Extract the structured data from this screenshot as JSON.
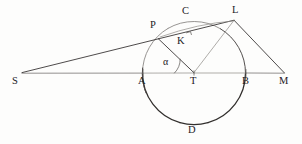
{
  "figure": {
    "kind": "geometric-construction-diagram",
    "width": 302,
    "height": 144,
    "background_color": "#fdfdfc",
    "ink_color": "#2e2b2a",
    "labels": [
      {
        "id": "S",
        "text": "S",
        "x": 12,
        "y": 76,
        "anchor_x": 22,
        "anchor_y": 73
      },
      {
        "id": "A",
        "text": "A",
        "x": 138,
        "y": 76,
        "anchor_x": 143,
        "anchor_y": 73
      },
      {
        "id": "T",
        "text": "T",
        "x": 190,
        "y": 76,
        "anchor_x": 194,
        "anchor_y": 73
      },
      {
        "id": "B",
        "text": "B",
        "x": 242,
        "y": 76,
        "anchor_x": 246,
        "anchor_y": 73
      },
      {
        "id": "M",
        "text": "M",
        "x": 279,
        "y": 76,
        "anchor_x": 284,
        "anchor_y": 73
      },
      {
        "id": "P",
        "text": "P",
        "x": 150,
        "y": 20,
        "anchor_x": 158,
        "anchor_y": 38
      },
      {
        "id": "C",
        "text": "C",
        "x": 182,
        "y": 6,
        "anchor_x": 192,
        "anchor_y": 22
      },
      {
        "id": "L",
        "text": "L",
        "x": 232,
        "y": 5,
        "anchor_x": 234,
        "anchor_y": 20
      },
      {
        "id": "K",
        "text": "K",
        "x": 177,
        "y": 36,
        "anchor_x": 189,
        "anchor_y": 31
      },
      {
        "id": "D",
        "text": "D",
        "x": 188,
        "y": 125,
        "anchor_x": 194,
        "anchor_y": 124
      },
      {
        "id": "alpha",
        "text": "α",
        "x": 163,
        "y": 57,
        "anchor_x": 170,
        "anchor_y": 66
      }
    ],
    "points": {
      "S": [
        22,
        73
      ],
      "A": [
        143,
        73
      ],
      "T": [
        194,
        73
      ],
      "B": [
        246,
        73
      ],
      "M": [
        284,
        73
      ],
      "P": [
        158.5,
        38.5
      ],
      "C": [
        192,
        22
      ],
      "L": [
        234,
        20
      ],
      "K": [
        189.5,
        31.5
      ],
      "D": [
        194,
        124
      ]
    },
    "circle": {
      "center_x": 194,
      "center_y": 73,
      "radius": 51.5
    },
    "segments": [
      {
        "id": "S-L",
        "from": "S",
        "to": "L",
        "note": "tangent ray through P"
      },
      {
        "id": "S-M",
        "from": "S",
        "to": "M",
        "note": "baseline through A, T, B"
      },
      {
        "id": "T-P",
        "from": "T",
        "to": "P",
        "note": "radius to P"
      },
      {
        "id": "T-L",
        "from": "T",
        "to": "L",
        "note": "ray to L"
      },
      {
        "id": "L-M",
        "from": "L",
        "to": "M",
        "note": "tangent-ish to M"
      },
      {
        "id": "P-L",
        "from": "P",
        "to": "L",
        "note": "chord P to L"
      }
    ],
    "marks": [
      {
        "id": "angle-alpha-arc",
        "at": "T",
        "between": [
          "A",
          "P"
        ],
        "symbol": "α"
      },
      {
        "id": "right-angle-tick",
        "at": "K",
        "note": "perpendicular tick on P-L"
      }
    ]
  }
}
